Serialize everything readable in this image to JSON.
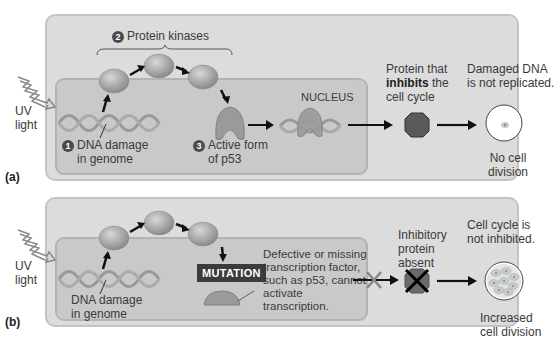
{
  "panel_a": {
    "label": "(a)",
    "uv_label": [
      "UV",
      "light"
    ],
    "step1": {
      "num": "1",
      "text": [
        "DNA damage",
        "in genome"
      ]
    },
    "step2": {
      "num": "2",
      "text": "Protein kinases"
    },
    "step3": {
      "num": "3",
      "text": [
        "Active form",
        "of p53"
      ]
    },
    "nucleus_label": "NUCLEUS",
    "inhibitor_text": {
      "line1": "Protein that",
      "bold": "inhibits",
      "line2_rest": " the",
      "line3": "cell cycle"
    },
    "outcome_top": [
      "Damaged DNA",
      "is not replicated."
    ],
    "outcome_bottom": [
      "No cell",
      "division"
    ]
  },
  "panel_b": {
    "label": "(b)",
    "uv_label": [
      "UV",
      "light"
    ],
    "dna_label": [
      "DNA damage",
      "in genome"
    ],
    "mutation_label": "MUTATION",
    "defect_text": [
      "Defective or missing",
      "transcription factor,",
      "such as p53, cannot",
      "activate",
      "transcription."
    ],
    "inhibitor_text": [
      "Inhibitory",
      "protein",
      "absent"
    ],
    "outcome_top": [
      "Cell cycle is",
      "not inhibited."
    ],
    "outcome_bottom": [
      "Increased",
      "cell division"
    ]
  },
  "colors": {
    "outer_box": "#dcdcdc",
    "inner_box": "#c9c9c9",
    "protein": "#9a9a9a",
    "octagon": "#5a5a5a",
    "mutation_bg": "#3b3b3b"
  }
}
